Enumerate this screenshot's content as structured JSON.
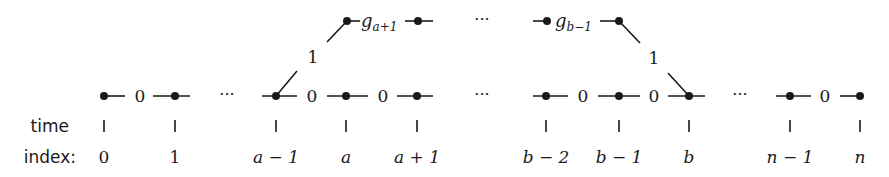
{
  "diagram": {
    "row_labels": {
      "time": "time",
      "index": "index:"
    },
    "index_labels": [
      "0",
      "1",
      "a − 1",
      "a",
      "a + 1",
      "b − 2",
      "b − 1",
      "b",
      "n − 1",
      "n"
    ],
    "bottom_edge_labels": [
      "0",
      "0",
      "0",
      "0",
      "0",
      "0"
    ],
    "top_labels": {
      "g_a1_base": "g",
      "g_a1_sub": "a+1",
      "g_b1_base": "g",
      "g_b1_sub": "b−1"
    },
    "transition_labels": {
      "up": "1",
      "down": "1"
    },
    "ellipsis": "···",
    "colors": {
      "ink": "#1a1a1a",
      "background": "#ffffff"
    }
  }
}
